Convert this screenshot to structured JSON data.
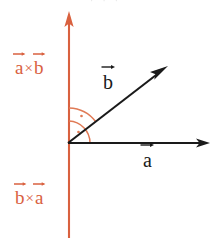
{
  "figure": {
    "background_color": "#ffffff",
    "width": 211,
    "height": 238,
    "top_clipped_text": "· · ·"
  },
  "colors": {
    "accent_orange": "#d9613f",
    "axis_black": "#1a1a1a",
    "arc_orange": "#e07a55",
    "background": "#ffffff"
  },
  "labels": {
    "a_cross_b": {
      "base_1": "a",
      "operator": "×",
      "base_2": "b",
      "color": "#d9613f"
    },
    "b_cross_a": {
      "base_1": "b",
      "operator": "×",
      "base_2": "a",
      "color": "#d9613f"
    },
    "vector_b": {
      "base": "b",
      "color": "#1a1a1a"
    },
    "vector_a": {
      "base": "a",
      "color": "#1a1a1a"
    }
  },
  "geometry": {
    "origin": {
      "x": 68,
      "y": 143
    },
    "vertical_axis": {
      "x": 69,
      "y_top": 12,
      "y_bottom": 238,
      "color": "#d9613f",
      "arrow_at": "top"
    },
    "horizontal_axis": {
      "x_start": 68,
      "x_end": 209,
      "y": 143,
      "color": "#1a1a1a",
      "arrow_at": "right"
    },
    "vector_b_line": {
      "x_start": 68,
      "y_start": 143,
      "x_end": 167,
      "y_end": 67,
      "color": "#1a1a1a",
      "arrow_at": "end"
    },
    "arcs": [
      {
        "radius": 22,
        "start_deg": 0,
        "end_deg": 90,
        "note": "angle from a to vertical",
        "dot": true
      },
      {
        "radius": 35,
        "start_deg": 37,
        "end_deg": 90,
        "note": "angle from b to vertical",
        "dot": true
      }
    ]
  }
}
